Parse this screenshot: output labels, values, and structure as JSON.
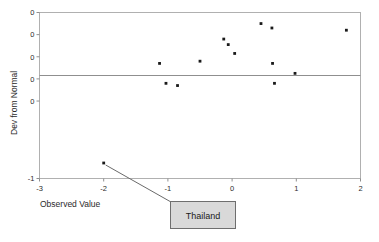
{
  "chart_data": {
    "type": "scatter",
    "title": "",
    "xlabel": "Observed Value",
    "ylabel": "Dev from Normal",
    "xlim": [
      -3,
      2
    ],
    "ylim": [
      -1.0,
      0.5
    ],
    "grid": false,
    "legend": null,
    "x_ticks": [
      -3,
      -2,
      -1,
      0,
      1,
      2
    ],
    "x_tick_labels": [
      "-3",
      "-2",
      "-1",
      "0",
      "1",
      "2"
    ],
    "y_ticks": [
      0.5,
      0.3,
      0.1,
      -0.1,
      -0.3,
      -1.0
    ],
    "y_tick_labels": [
      "0",
      "0",
      "0",
      "0",
      "0",
      "-1"
    ],
    "reference_line": {
      "y": 0.1,
      "label": ""
    },
    "points": [
      {
        "x": -2.0,
        "y": -0.86,
        "label": "Thailand"
      },
      {
        "x": -1.13,
        "y": 0.04,
        "label": ""
      },
      {
        "x": -1.03,
        "y": -0.14,
        "label": ""
      },
      {
        "x": -0.85,
        "y": -0.16,
        "label": ""
      },
      {
        "x": -0.5,
        "y": 0.06,
        "label": ""
      },
      {
        "x": -0.13,
        "y": 0.26,
        "label": ""
      },
      {
        "x": -0.06,
        "y": 0.21,
        "label": ""
      },
      {
        "x": 0.04,
        "y": 0.13,
        "label": ""
      },
      {
        "x": 0.45,
        "y": 0.4,
        "label": ""
      },
      {
        "x": 0.62,
        "y": 0.36,
        "label": ""
      },
      {
        "x": 0.63,
        "y": 0.04,
        "label": ""
      },
      {
        "x": 0.66,
        "y": -0.14,
        "label": ""
      },
      {
        "x": 0.98,
        "y": -0.05,
        "label": ""
      },
      {
        "x": 1.78,
        "y": 0.34,
        "label": ""
      }
    ],
    "annotations": [
      {
        "text": "Thailand",
        "target_x": -2.0,
        "target_y": -0.86,
        "kind": "callout-box"
      }
    ],
    "colors": {
      "marker": "#1a1a1a",
      "frame": "#b0b0b0",
      "zero_line": "#8f8f8f",
      "callout_fill": "#d9d9d9",
      "callout_border": "#6e6e6e",
      "background": "#ffffff",
      "text": "#2b2b2b"
    }
  }
}
